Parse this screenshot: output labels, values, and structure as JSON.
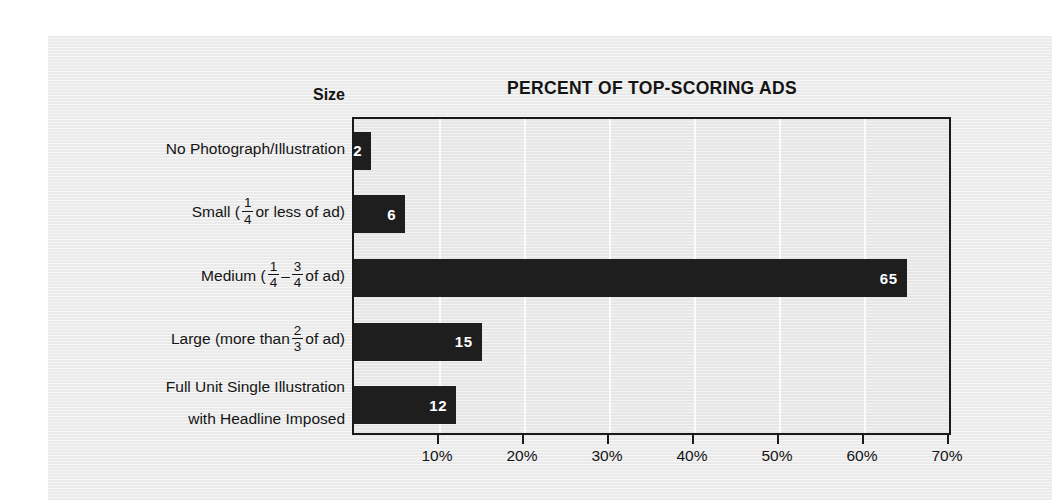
{
  "chart_data": {
    "type": "bar",
    "orientation": "horizontal",
    "title": "PERCENT OF TOP-SCORING ADS",
    "category_axis_title": "Size",
    "xlabel": "",
    "ylabel": "",
    "xlim": [
      0,
      70
    ],
    "xtick_labels": [
      "10%",
      "20%",
      "30%",
      "40%",
      "50%",
      "60%",
      "70%"
    ],
    "xtick_values": [
      10,
      20,
      30,
      40,
      50,
      60,
      70
    ],
    "grid": true,
    "legend": false,
    "categories": [
      "No Photograph/Illustration",
      "Small (1/4 or less of ad)",
      "Medium (1/4 – 3/4 of ad)",
      "Large (more than 2/3 of ad)",
      "Full Unit Single Illustration with Headline Imposed"
    ],
    "values": [
      2,
      6,
      65,
      15,
      12
    ],
    "value_labels": [
      "2",
      "6",
      "65",
      "15",
      "12"
    ],
    "bar_color": "#1e1e1e",
    "value_label_color": "#ffffff",
    "plot_background": "#e9e9e9",
    "gridline_color": "#fbfbfb"
  },
  "categories_rich": [
    {
      "id": "no-photograph",
      "lines": [
        [
          {
            "t": "text",
            "v": "No Photograph/Illustration"
          }
        ]
      ]
    },
    {
      "id": "small",
      "lines": [
        [
          {
            "t": "text",
            "v": "Small ("
          },
          {
            "t": "frac",
            "num": "1",
            "den": "4"
          },
          {
            "t": "text",
            "v": " or less of ad)"
          }
        ]
      ]
    },
    {
      "id": "medium",
      "lines": [
        [
          {
            "t": "text",
            "v": "Medium ("
          },
          {
            "t": "frac",
            "num": "1",
            "den": "4"
          },
          {
            "t": "text",
            "v": " – "
          },
          {
            "t": "frac",
            "num": "3",
            "den": "4"
          },
          {
            "t": "text",
            "v": " of ad)"
          }
        ]
      ]
    },
    {
      "id": "large",
      "lines": [
        [
          {
            "t": "text",
            "v": "Large (more than "
          },
          {
            "t": "frac",
            "num": "2",
            "den": "3"
          },
          {
            "t": "text",
            "v": " of ad)"
          }
        ]
      ]
    },
    {
      "id": "full-unit",
      "lines": [
        [
          {
            "t": "text",
            "v": "Full Unit Single Illustration"
          }
        ],
        [
          {
            "t": "text",
            "v": "with Headline Imposed"
          }
        ]
      ]
    }
  ]
}
